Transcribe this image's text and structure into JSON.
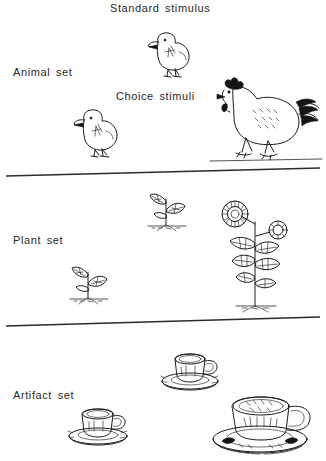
{
  "figure": {
    "title_standard": "Standard stimulus",
    "label_choice": "Choice stimuli"
  },
  "sets": [
    {
      "label": "Animal set",
      "standard_icon": "chick-icon",
      "choice_small_icon": "chick-icon",
      "choice_large_icon": "hen-icon"
    },
    {
      "label": "Plant set",
      "standard_icon": "seedling-icon",
      "choice_small_icon": "seedling-icon",
      "choice_large_icon": "sunflower-icon"
    },
    {
      "label": "Artifact set",
      "standard_icon": "cup-and-saucer-icon",
      "choice_small_icon": "cup-and-saucer-icon",
      "choice_large_icon": "teacup-and-saucer-icon"
    }
  ],
  "colors": {
    "ink": "#1c1c1c",
    "paper": "#fefefe",
    "text": "#2a2a2a"
  }
}
